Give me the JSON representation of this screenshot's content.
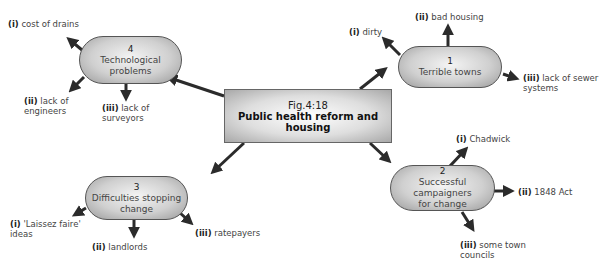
{
  "center": {
    "fig": "Fig.4:18",
    "title": "Public health reform and housing"
  },
  "nodes": [
    {
      "number": "1",
      "label": "Terrible towns",
      "label_line2": "",
      "branches": [
        {
          "numeral": "(i)",
          "text": "dirty"
        },
        {
          "numeral": "(ii)",
          "text": "bad housing"
        },
        {
          "numeral": "(iii)",
          "text": "lack of sewer",
          "text2": "systems"
        }
      ]
    },
    {
      "number": "2",
      "label": "Successful campaigners",
      "label_line2": "for change",
      "branches": [
        {
          "numeral": "(i)",
          "text": "Chadwick"
        },
        {
          "numeral": "(ii)",
          "text": "1848 Act"
        },
        {
          "numeral": "(iii)",
          "text": "some town",
          "text2": "councils"
        }
      ]
    },
    {
      "number": "3",
      "label": "Difficulties stopping",
      "label_line2": "change",
      "branches": [
        {
          "numeral": "(i)",
          "text": "'Laissez faire'",
          "text2": "ideas"
        },
        {
          "numeral": "(ii)",
          "text": "landlords"
        },
        {
          "numeral": "(iii)",
          "text": "ratepayers"
        }
      ]
    },
    {
      "number": "4",
      "label": "Technological problems",
      "label_line2": "",
      "branches": [
        {
          "numeral": "(i)",
          "text": "cost of drains"
        },
        {
          "numeral": "(ii)",
          "text": "lack of",
          "text2": "engineers"
        },
        {
          "numeral": "(iii)",
          "text": "lack of",
          "text2": "surveyors"
        }
      ]
    }
  ],
  "colors": {
    "arrow": "#2b2b2b",
    "pill_border": "#555555"
  }
}
